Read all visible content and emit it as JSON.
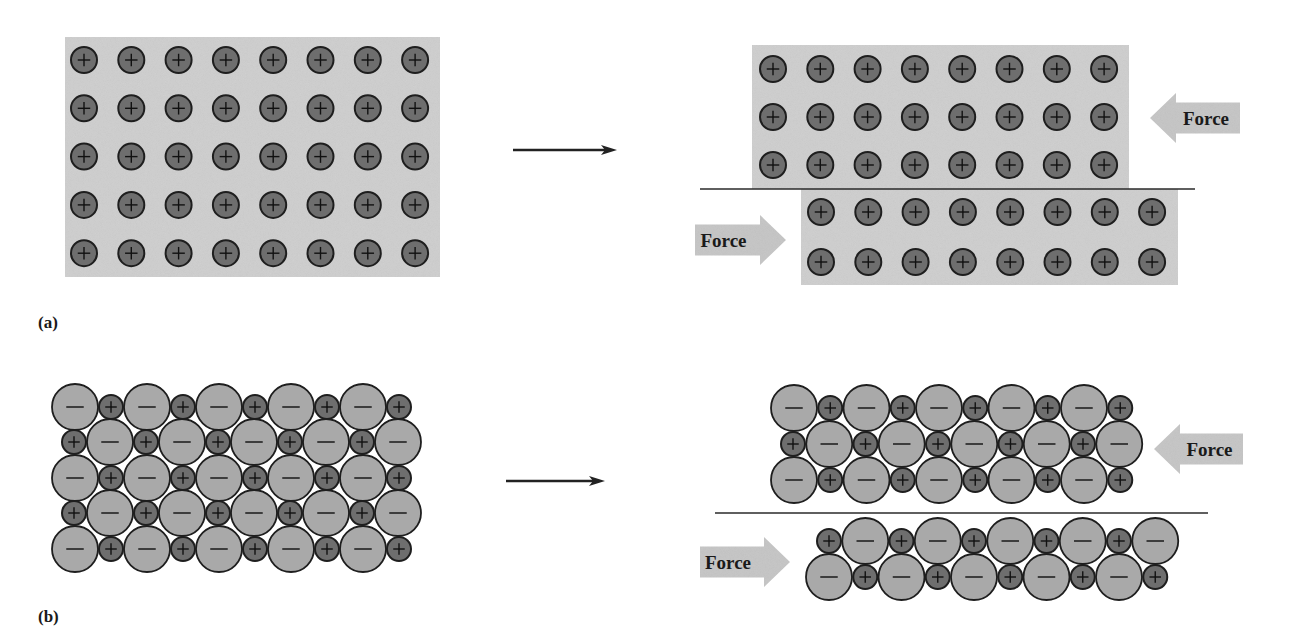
{
  "figure": {
    "panel_labels": [
      {
        "id": "a",
        "text": "(a)",
        "x": 38,
        "y": 313
      },
      {
        "id": "b",
        "text": "(b)",
        "x": 38,
        "y": 607
      }
    ],
    "force_label": "Force",
    "colors": {
      "block_fill": "#d2d2d2",
      "cation_fill": "#6e6e6e",
      "anion_fill": "#a9a9a9",
      "outline": "#1e1e1e",
      "arrow_fill": "#c9c9c9",
      "line": "#2a2a2a"
    },
    "transition_arrows": [
      {
        "id": "a",
        "x1": 513,
        "x2": 617,
        "y": 150
      },
      {
        "id": "b",
        "x1": 506,
        "x2": 605,
        "y": 481
      }
    ],
    "panel_a": {
      "description": "Metal: array of positive ions in sea of electrons; shear shifts planes without repulsion",
      "before": {
        "block": {
          "x": 65,
          "y": 37,
          "w": 375,
          "h": 240
        },
        "ion_sign": "+",
        "cols": 8,
        "rows": 5,
        "x0": 84,
        "dx": 47.3,
        "y0": 60,
        "dy": 48.3,
        "r": 13
      },
      "after_upper": {
        "block": {
          "x": 752,
          "y": 45,
          "w": 377,
          "h": 144
        },
        "cols": 8,
        "rows": 3,
        "x0": 773,
        "dx": 47.3,
        "y0": 69,
        "dy": 48,
        "r": 13
      },
      "after_lower": {
        "block": {
          "x": 801,
          "y": 189,
          "w": 377,
          "h": 96
        },
        "cols": 8,
        "rows": 2,
        "x0": 821,
        "dx": 47.3,
        "y0": 212,
        "dy": 50,
        "r": 13
      },
      "slip_line": {
        "x1": 700,
        "x2": 1195,
        "y": 189
      },
      "force_arrows": [
        {
          "direction": "left",
          "tip_x": 1150,
          "tail_x": 1240,
          "cy": 118,
          "label": "Force"
        },
        {
          "direction": "right",
          "tip_x": 786,
          "tail_x": 695,
          "cy": 240,
          "label": "Force"
        }
      ]
    },
    "panel_b": {
      "description": "Ionic crystal: shear brings like charges adjacent, causing repulsion and fracture",
      "before": {
        "rows": [
          {
            "y": 407,
            "start": "-",
            "x0": 75,
            "count": 10
          },
          {
            "y": 442,
            "start": "+",
            "x0": 74,
            "count": 10
          },
          {
            "y": 478,
            "start": "-",
            "x0": 75,
            "count": 10
          },
          {
            "y": 513,
            "start": "+",
            "x0": 74,
            "count": 10
          },
          {
            "y": 549,
            "start": "-",
            "x0": 75,
            "count": 10
          }
        ],
        "pair_dx": 72,
        "anion_r": 23,
        "cation_r": 12
      },
      "after_upper": {
        "rows": [
          {
            "y": 408,
            "start": "-",
            "x0": 794,
            "count": 10
          },
          {
            "y": 444,
            "start": "+",
            "x0": 793,
            "count": 10
          },
          {
            "y": 480,
            "start": "-",
            "x0": 794,
            "count": 10
          }
        ],
        "pair_dx": 72.5,
        "anion_r": 23,
        "cation_r": 12
      },
      "after_lower": {
        "rows": [
          {
            "y": 541,
            "start": "+",
            "x0": 829,
            "count": 10
          },
          {
            "y": 577,
            "start": "-",
            "x0": 829,
            "count": 10
          }
        ],
        "pair_dx": 72.5,
        "anion_r": 23,
        "cation_r": 12
      },
      "slip_line": {
        "x1": 715,
        "x2": 1208,
        "y": 513
      },
      "force_arrows": [
        {
          "direction": "left",
          "tip_x": 1154,
          "tail_x": 1243,
          "cy": 449,
          "label": "Force"
        },
        {
          "direction": "right",
          "tip_x": 790,
          "tail_x": 700,
          "cy": 562,
          "label": "Force"
        }
      ]
    }
  }
}
